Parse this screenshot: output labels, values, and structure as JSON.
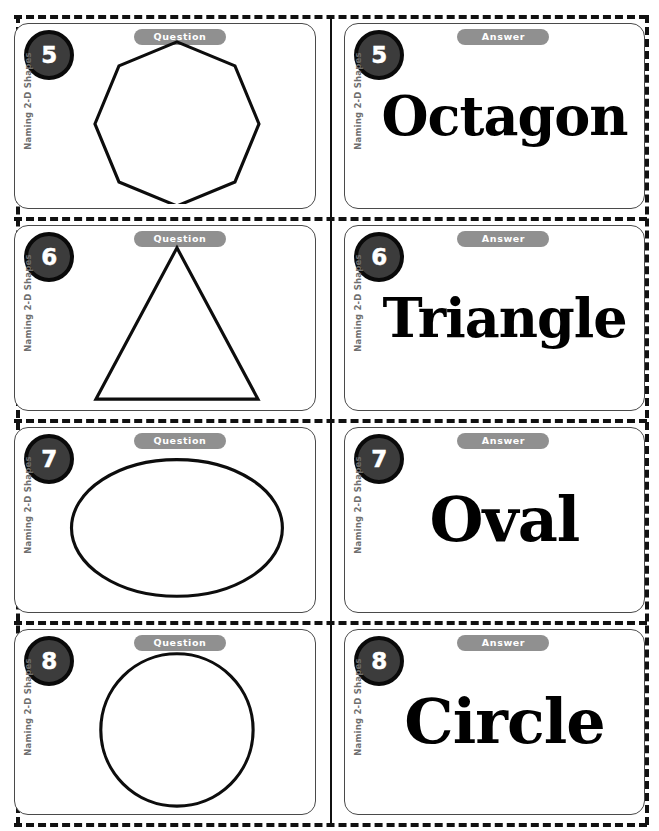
{
  "worksheet": {
    "topic_label": "Naming 2-D Shapes",
    "question_label": "Question",
    "answer_label": "Answer",
    "accent_colors": {
      "badge_fill": "#3c3c3c",
      "badge_ring": "#0a0a0a",
      "pill_fill": "#909090",
      "pill_text": "#ffffff",
      "side_label_text": "#6e6e6e",
      "card_border": "#4a4a4a",
      "shape_stroke": "#0d0d0d",
      "cut_line": "#111111",
      "page_background": "#ffffff"
    }
  },
  "cards": [
    {
      "number": "5",
      "side": "question",
      "side_label": "Naming 2-D Shapes",
      "header": "Question",
      "shape": "octagon",
      "answer": "Octagon"
    },
    {
      "number": "5",
      "side": "answer",
      "side_label": "Naming 2-D Shapes",
      "header": "Answer",
      "shape": "octagon",
      "answer": "Octagon"
    },
    {
      "number": "6",
      "side": "question",
      "side_label": "Naming 2-D Shapes",
      "header": "Question",
      "shape": "triangle",
      "answer": "Triangle"
    },
    {
      "number": "6",
      "side": "answer",
      "side_label": "Naming 2-D Shapes",
      "header": "Answer",
      "shape": "triangle",
      "answer": "Triangle"
    },
    {
      "number": "7",
      "side": "question",
      "side_label": "Naming 2-D Shapes",
      "header": "Question",
      "shape": "oval",
      "answer": "Oval"
    },
    {
      "number": "7",
      "side": "answer",
      "side_label": "Naming 2-D Shapes",
      "header": "Answer",
      "shape": "oval",
      "answer": "Oval"
    },
    {
      "number": "8",
      "side": "question",
      "side_label": "Naming 2-D Shapes",
      "header": "Question",
      "shape": "circle",
      "answer": "Circle"
    },
    {
      "number": "8",
      "side": "answer",
      "side_label": "Naming 2-D Shapes",
      "header": "Answer",
      "shape": "circle",
      "answer": "Circle"
    }
  ]
}
